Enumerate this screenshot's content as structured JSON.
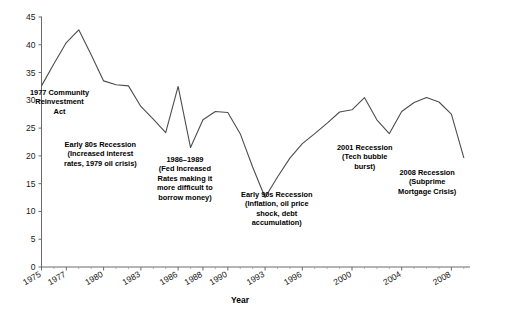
{
  "chart_data": {
    "type": "line",
    "title": "",
    "xlabel": "Year",
    "ylabel": "",
    "xlim": [
      1975,
      2009.5
    ],
    "ylim": [
      0,
      45
    ],
    "grid": false,
    "legend": null,
    "x_tick_labels": [
      "1975",
      "1977",
      "1980",
      "1983",
      "1986",
      "1988",
      "1990",
      "1993",
      "1996",
      "2000",
      "2004",
      "2008"
    ],
    "x_tick_values": [
      1975,
      1977,
      1980,
      1983,
      1986,
      1988,
      1990,
      1993,
      1996,
      2000,
      2004,
      2008
    ],
    "y_tick_labels": [
      "0",
      "5",
      "10",
      "15",
      "20",
      "25",
      "30",
      "35",
      "40",
      "45"
    ],
    "y_tick_values": [
      0,
      5,
      10,
      15,
      20,
      25,
      30,
      35,
      40,
      45
    ],
    "line_color": "#4d4d4d",
    "series": [
      {
        "name": "series-1",
        "x": [
          1975,
          1976,
          1977,
          1978,
          1979,
          1980,
          1981,
          1982,
          1983,
          1984,
          1985,
          1986,
          1987,
          1988,
          1989,
          1990,
          1991,
          1992,
          1993,
          1994,
          1995,
          1996,
          1997,
          1998,
          1999,
          2000,
          2001,
          2002,
          2003,
          2004,
          2005,
          2006,
          2007,
          2008,
          2009
        ],
        "values": [
          32.6,
          36.6,
          40.4,
          42.7,
          38.2,
          33.5,
          32.8,
          32.6,
          28.9,
          26.6,
          24.2,
          32.5,
          21.5,
          26.5,
          28.0,
          27.8,
          24.0,
          18.0,
          12.5,
          16.2,
          19.6,
          22.2,
          24.0,
          25.9,
          27.9,
          28.3,
          30.5,
          26.5,
          24.0,
          28.0,
          29.6,
          30.5,
          29.7,
          27.5,
          19.7
        ]
      }
    ],
    "annotations": [
      {
        "id": "annot-1977-cra",
        "align": "center",
        "lines": [
          "1977 Community",
          "Reinvestment",
          "Act"
        ]
      },
      {
        "id": "annot-early-80s-recession",
        "align": "center",
        "lines": [
          "Early 80s Recession",
          "(Increased interest",
          "rates, 1979 oil crisis)"
        ]
      },
      {
        "id": "annot-1986-1989-fed",
        "align": "center",
        "lines": [
          "1986–1989",
          "(Fed Increased",
          "Rates making it",
          "more difficult to",
          "borrow money)"
        ]
      },
      {
        "id": "annot-early-90s-recession",
        "align": "center",
        "lines": [
          "Early 90s Recession",
          "(Inflation, oil price",
          "shock, debt",
          "accumulation)"
        ]
      },
      {
        "id": "annot-2001-recession",
        "align": "center",
        "lines": [
          "2001 Recession",
          "(Tech bubble",
          "burst)"
        ]
      },
      {
        "id": "annot-2008-recession",
        "align": "center",
        "lines": [
          "2008 Recession",
          "(Subprime",
          "Mortgage Crisis)"
        ]
      }
    ]
  }
}
